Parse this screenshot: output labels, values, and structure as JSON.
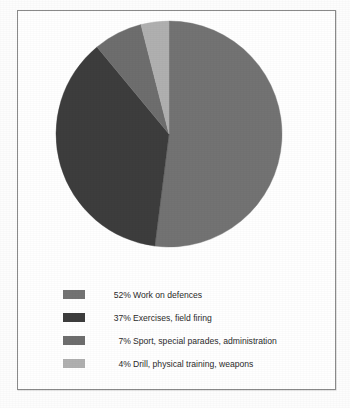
{
  "chart_data": {
    "type": "pie",
    "title": "",
    "subtitle": "",
    "xlabel": "",
    "ylabel": "",
    "legend_position": "bottom-left",
    "grid": false,
    "start_angle_deg": 0,
    "direction": "clockwise",
    "categories": [
      "Work on defences",
      "Exercises, field firing",
      "Sport, special parades, administration",
      "Drill, physical training, weapons"
    ],
    "values": [
      52,
      37,
      7,
      4
    ],
    "value_unit": "%",
    "colors": [
      "#737373",
      "#3d3d3d",
      "#6e6e6e",
      "#b0b0b0"
    ],
    "slices": [
      {
        "percent_label": "52%",
        "value": 52,
        "label": "Work on defences",
        "color": "#737373",
        "start_deg": 0,
        "end_deg": 187.2
      },
      {
        "percent_label": "37%",
        "value": 37,
        "label": "Exercises, field firing",
        "color": "#3d3d3d",
        "start_deg": 187.2,
        "end_deg": 320.4
      },
      {
        "percent_label": "7%",
        "value": 7,
        "label": "Sport, special parades, administration",
        "color": "#6e6e6e",
        "start_deg": 320.4,
        "end_deg": 345.6
      },
      {
        "percent_label": "4%",
        "value": 4,
        "label": "Drill, physical training, weapons",
        "color": "#b0b0b0",
        "start_deg": 345.6,
        "end_deg": 360
      }
    ]
  },
  "legend": {
    "rows": [
      {
        "percent": "52%",
        "description": "Work on defences",
        "color": "#737373"
      },
      {
        "percent": "37%",
        "description": "Exercises, field firing",
        "color": "#3d3d3d"
      },
      {
        "percent": "7%",
        "description": "Sport, special parades, administration",
        "color": "#6e6e6e"
      },
      {
        "percent": "4%",
        "description": "Drill, physical training, weapons",
        "color": "#b0b0b0"
      }
    ]
  },
  "style": {
    "frame_color": "#8a8a8a",
    "background": "#ffffff",
    "text_color": "#2b2b2b"
  }
}
